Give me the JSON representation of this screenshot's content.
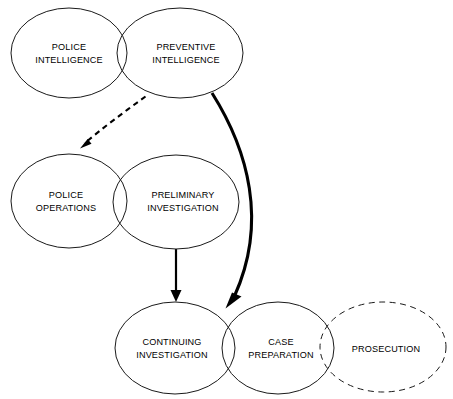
{
  "diagram": {
    "type": "venn-flow-diagram",
    "canvas": {
      "width": 453,
      "height": 399
    },
    "background_color": "#ffffff",
    "stroke_color": "#1a1a1a",
    "nodes": [
      {
        "id": "police-intelligence",
        "label_line1": "POLICE",
        "label_line2": "INTELLIGENCE",
        "border": "solid",
        "cx": 69,
        "cy": 53,
        "rx": 58,
        "ry": 45
      },
      {
        "id": "preventive-intelligence",
        "label_line1": "PREVENTIVE",
        "label_line2": "INTELLIGENCE",
        "border": "solid",
        "cx": 180,
        "cy": 53,
        "rx": 63,
        "ry": 45
      },
      {
        "id": "police-operations",
        "label_line1": "POLICE",
        "label_line2": "OPERATIONS",
        "border": "solid",
        "cx": 69,
        "cy": 201,
        "rx": 58,
        "ry": 47
      },
      {
        "id": "preliminary-investigation",
        "label_line1": "PRELIMINARY",
        "label_line2": "INVESTIGATION",
        "border": "solid",
        "cx": 176,
        "cy": 202,
        "rx": 63,
        "ry": 47
      },
      {
        "id": "continuing-investigation",
        "label_line1": "CONTINUING",
        "label_line2": "INVESTIGATION",
        "border": "solid",
        "cx": 175,
        "cy": 348,
        "rx": 60,
        "ry": 46
      },
      {
        "id": "case-preparation",
        "label_line1": "CASE",
        "label_line2": "PREPARATION",
        "border": "solid",
        "cx": 278,
        "cy": 348,
        "rx": 56,
        "ry": 46
      },
      {
        "id": "prosecution",
        "label_line1": "PROSECUTION",
        "label_line2": "",
        "border": "dashed",
        "cx": 383,
        "cy": 347,
        "rx": 63,
        "ry": 45
      }
    ],
    "edges": [
      {
        "id": "preventive-to-operations",
        "from": "preventive-intelligence",
        "to": "police-operations",
        "style": "dashed",
        "weight": "thin"
      },
      {
        "id": "preventive-to-case-preparation",
        "from": "preventive-intelligence",
        "to": "case-preparation",
        "style": "solid",
        "weight": "thick"
      },
      {
        "id": "preliminary-to-continuing",
        "from": "preliminary-investigation",
        "to": "continuing-investigation",
        "style": "solid",
        "weight": "thin"
      }
    ]
  }
}
